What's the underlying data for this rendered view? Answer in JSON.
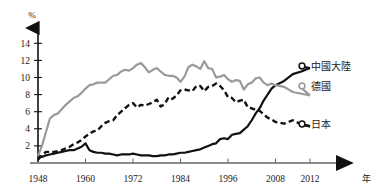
{
  "chart_data": {
    "type": "line",
    "title": "",
    "xlabel": "年",
    "ylabel": "%",
    "xlim": [
      1948,
      2016
    ],
    "ylim": [
      0,
      15
    ],
    "grid": false,
    "legend_position": "right",
    "x_ticks": [
      "1948",
      "1960",
      "1972",
      "1984",
      "1996",
      "2008",
      "2012"
    ],
    "x_tick_values": [
      1948,
      1960,
      1972,
      1984,
      1996,
      2008,
      2012
    ],
    "y_ticks": [
      "2",
      "4",
      "6",
      "8",
      "10",
      "12",
      "14"
    ],
    "y_tick_values": [
      2,
      4,
      6,
      8,
      10,
      12,
      14
    ],
    "series": [
      {
        "name": "中國大陸",
        "style": "solid",
        "color": "#111111",
        "marker_end": "open-circle",
        "x": [
          1948,
          1949,
          1950,
          1951,
          1952,
          1953,
          1954,
          1955,
          1956,
          1957,
          1958,
          1959,
          1960,
          1961,
          1962,
          1963,
          1964,
          1965,
          1966,
          1967,
          1968,
          1969,
          1970,
          1971,
          1972,
          1973,
          1974,
          1975,
          1976,
          1977,
          1978,
          1979,
          1980,
          1981,
          1982,
          1983,
          1984,
          1985,
          1986,
          1987,
          1988,
          1989,
          1990,
          1991,
          1992,
          1993,
          1994,
          1995,
          1996,
          1997,
          1998,
          1999,
          2000,
          2001,
          2002,
          2003,
          2004,
          2005,
          2006,
          2007,
          2008,
          2009,
          2010,
          2011,
          2012
        ],
        "y": [
          0.9,
          0.7,
          0.9,
          1.0,
          1.1,
          1.2,
          1.3,
          1.4,
          1.5,
          1.5,
          1.7,
          1.9,
          2.3,
          1.5,
          1.3,
          1.2,
          1.2,
          1.1,
          1.1,
          1.0,
          0.9,
          1.0,
          1.0,
          1.0,
          1.1,
          1.0,
          0.9,
          0.9,
          0.9,
          0.8,
          0.8,
          0.9,
          0.9,
          1.0,
          1.0,
          1.1,
          1.2,
          1.2,
          1.3,
          1.4,
          1.5,
          1.6,
          1.8,
          2.0,
          2.2,
          2.3,
          2.8,
          2.9,
          2.8,
          3.3,
          3.4,
          3.5,
          3.9,
          4.3,
          5.0,
          5.8,
          6.4,
          7.3,
          8.0,
          8.7,
          9.1,
          9.6,
          10.4,
          10.7,
          11.1
        ]
      },
      {
        "name": "德國",
        "style": "solid",
        "color": "#9a9a9a",
        "marker_end": "open-circle",
        "x": [
          1948,
          1949,
          1950,
          1951,
          1952,
          1953,
          1954,
          1955,
          1956,
          1957,
          1958,
          1959,
          1960,
          1961,
          1962,
          1963,
          1964,
          1965,
          1966,
          1967,
          1968,
          1969,
          1970,
          1971,
          1972,
          1973,
          1974,
          1975,
          1976,
          1977,
          1978,
          1979,
          1980,
          1981,
          1982,
          1983,
          1984,
          1985,
          1986,
          1987,
          1988,
          1989,
          1990,
          1991,
          1992,
          1993,
          1994,
          1995,
          1996,
          1997,
          1998,
          1999,
          2000,
          2001,
          2002,
          2003,
          2004,
          2005,
          2006,
          2007,
          2008,
          2009,
          2010,
          2011,
          2012
        ],
        "y": [
          0.8,
          2.0,
          3.6,
          5.2,
          5.6,
          5.8,
          6.3,
          6.8,
          7.2,
          7.6,
          7.8,
          8.2,
          8.7,
          9.1,
          9.2,
          9.4,
          9.4,
          9.4,
          9.8,
          10.2,
          10.3,
          10.7,
          10.9,
          10.8,
          11.1,
          11.5,
          11.7,
          11.2,
          10.6,
          10.9,
          11.1,
          10.7,
          10.3,
          10.2,
          10.2,
          10.0,
          9.5,
          10.1,
          11.2,
          11.5,
          11.3,
          11.0,
          11.9,
          11.1,
          11.0,
          10.0,
          10.1,
          10.3,
          9.8,
          9.5,
          9.7,
          9.6,
          8.6,
          9.2,
          9.4,
          9.9,
          10.0,
          9.4,
          9.1,
          9.3,
          9.1,
          8.9,
          8.3,
          8.1,
          7.9
        ]
      },
      {
        "name": "日本",
        "style": "dashed",
        "color": "#111111",
        "marker_end": "open-circle",
        "x": [
          1948,
          1949,
          1950,
          1951,
          1952,
          1953,
          1954,
          1955,
          1956,
          1957,
          1958,
          1959,
          1960,
          1961,
          1962,
          1963,
          1964,
          1965,
          1966,
          1967,
          1968,
          1969,
          1970,
          1971,
          1972,
          1973,
          1974,
          1975,
          1976,
          1977,
          1978,
          1979,
          1980,
          1981,
          1982,
          1983,
          1984,
          1985,
          1986,
          1987,
          1988,
          1989,
          1990,
          1991,
          1992,
          1993,
          1994,
          1995,
          1996,
          1997,
          1998,
          1999,
          2000,
          2001,
          2002,
          2003,
          2004,
          2005,
          2006,
          2007,
          2008,
          2009,
          2010,
          2011,
          2012
        ],
        "y": [
          0.4,
          0.9,
          1.3,
          1.3,
          1.3,
          1.4,
          1.5,
          1.7,
          1.9,
          2.2,
          2.4,
          2.7,
          3.1,
          3.4,
          3.7,
          3.8,
          4.3,
          4.7,
          4.9,
          5.0,
          5.6,
          6.0,
          6.4,
          6.8,
          7.0,
          6.5,
          6.8,
          6.7,
          6.9,
          7.1,
          7.4,
          6.6,
          6.9,
          7.7,
          7.5,
          7.9,
          8.5,
          8.6,
          8.5,
          8.4,
          9.0,
          9.0,
          8.4,
          8.9,
          9.0,
          9.3,
          9.0,
          8.5,
          7.7,
          7.6,
          7.1,
          7.3,
          7.4,
          6.5,
          6.4,
          6.2,
          6.1,
          5.7,
          5.3,
          5.1,
          4.8,
          4.6,
          5.0,
          4.5,
          4.3
        ]
      }
    ]
  },
  "legend": {
    "items": [
      {
        "label": "中國大陸",
        "style": "solid",
        "color": "#111111"
      },
      {
        "label": "德國",
        "style": "solid",
        "color": "#9a9a9a"
      },
      {
        "label": "日本",
        "style": "dashed",
        "color": "#111111"
      }
    ]
  },
  "axes": {
    "y_unit": "%",
    "x_unit": "年"
  }
}
